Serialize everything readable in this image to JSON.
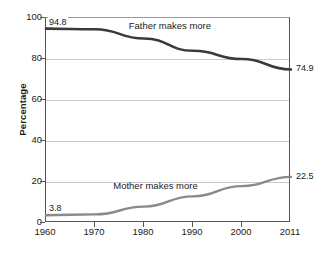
{
  "chart_data": {
    "type": "line",
    "title": "",
    "subtitle": "",
    "xlabel": "",
    "ylabel": "Percentage",
    "xlim": [
      1960,
      2011
    ],
    "ylim": [
      0,
      100
    ],
    "grid": true,
    "legend_position": "inline-annotations",
    "x_tick_labels": [
      "1960",
      "1970",
      "1980",
      "1990",
      "2000",
      "2011"
    ],
    "y_tick_labels": [
      "0",
      "20",
      "40",
      "60",
      "80",
      "100"
    ],
    "x": [
      1960,
      1970,
      1980,
      1990,
      2000,
      2011
    ],
    "series": [
      {
        "name": "Father makes more",
        "color": "#3a3a3a",
        "values": [
          94.8,
          94.5,
          90.0,
          84.0,
          80.0,
          74.9
        ],
        "start_label": "94.8",
        "end_label": "74.9"
      },
      {
        "name": "Mother makes more",
        "color": "#8a8a8a",
        "values": [
          3.8,
          4.2,
          8.0,
          13.0,
          18.0,
          22.5
        ],
        "start_label": "3.8",
        "end_label": "22.5"
      }
    ],
    "annotations": [
      {
        "text": "Father makes more",
        "x": 1986,
        "y": 95.5
      },
      {
        "text": "Mother makes more",
        "x": 1983,
        "y": 17.5
      }
    ]
  },
  "colors": {
    "father_line": "#3a3a3a",
    "mother_line": "#8a8a8a",
    "gridline": "#c9c9c9",
    "axis": "#555555",
    "text": "#1a1a1a",
    "background": "#ffffff"
  }
}
